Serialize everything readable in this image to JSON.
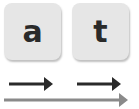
{
  "tiles": [
    {
      "letter": "a"
    },
    {
      "letter": "t"
    }
  ],
  "arrows": [
    {
      "name": "short-arrow-1",
      "color": "#2a2a2a"
    },
    {
      "name": "short-arrow-2",
      "color": "#2a2a2a"
    },
    {
      "name": "long-arrow",
      "color": "#8a8a8a"
    }
  ],
  "colors": {
    "tile_bg": "#e6e6e6",
    "letter": "#2a2a2a",
    "short_arrow": "#2a2a2a",
    "long_arrow": "#8a8a8a"
  }
}
